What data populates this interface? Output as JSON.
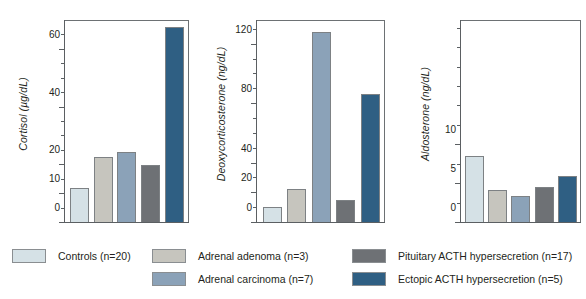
{
  "chart_data": [
    {
      "type": "bar",
      "title": "",
      "ylabel": "Cortisol (µg/dL)",
      "xlabel": "",
      "ylim": [
        0,
        70
      ],
      "grid": false,
      "tick_labels": [
        "0",
        "10",
        "20",
        "40",
        "60"
      ],
      "tick_values": [
        0,
        10,
        20,
        40,
        60
      ],
      "minor_tick_values": [
        5,
        15,
        25,
        30,
        35,
        45,
        50,
        55,
        65
      ],
      "categories": [
        "Controls (n=20)",
        "Adrenal adenoma (n=3)",
        "Adrenal carcinoma (n=7)",
        "Pituitary ACTH hypersecretion (n=17)",
        "Ectopic ACTH hypersecretion (n=5)"
      ],
      "values": [
        11.7,
        22.7,
        24.2,
        19.6,
        67.5
      ]
    },
    {
      "type": "bar",
      "title": "",
      "ylabel": "Deoxycorticosterone (ng/dL)",
      "xlabel": "",
      "ylim": [
        0,
        136
      ],
      "grid": false,
      "tick_labels": [
        "0",
        "20",
        "40",
        "80",
        "120"
      ],
      "tick_values": [
        0,
        20,
        40,
        80,
        120
      ],
      "minor_tick_values": [
        10,
        30,
        50,
        60,
        70,
        90,
        100,
        110,
        130
      ],
      "categories": [
        "Controls (n=20)",
        "Adrenal adenoma (n=3)",
        "Adrenal carcinoma (n=7)",
        "Pituitary ACTH hypersecretion (n=17)",
        "Ectopic ACTH hypersecretion (n=5)"
      ],
      "values": [
        10.0,
        22.0,
        128.0,
        15.0,
        86.0
      ]
    },
    {
      "type": "bar",
      "title": "",
      "ylabel": "Aldosterone (ng/dL)",
      "xlabel": "",
      "ylim": [
        0,
        26
      ],
      "grid": false,
      "tick_labels": [
        "0",
        "5",
        "10"
      ],
      "tick_values": [
        0,
        5,
        10
      ],
      "minor_tick_values": [
        2.5,
        7.5,
        12.5,
        15,
        17.5,
        20,
        22.5,
        25
      ],
      "categories": [
        "Controls (n=20)",
        "Adrenal adenoma (n=3)",
        "Adrenal carcinoma (n=7)",
        "Pituitary ACTH hypersecretion (n=17)",
        "Ectopic ACTH hypersecretion (n=5)"
      ],
      "values": [
        8.5,
        4.1,
        3.4,
        4.5,
        5.9
      ]
    }
  ],
  "legend": {
    "position": "bottom",
    "columns": [
      {
        "entries": [
          {
            "label": "Controls (n=20)",
            "color": "#d5e1e6"
          }
        ]
      },
      {
        "entries": [
          {
            "label": "Adrenal adenoma (n=3)",
            "color": "#c6c5be"
          },
          {
            "label": "Adrenal carcinoma (n=7)",
            "color": "#8ba2b8"
          }
        ]
      },
      {
        "entries": [
          {
            "label": "Pituitary ACTH hypersecretion (n=17)",
            "color": "#6e7175"
          },
          {
            "label": "Ectopic ACTH hypersecretion (n=5)",
            "color": "#2f5f83"
          }
        ]
      }
    ]
  },
  "series_colors": [
    "#d5e1e6",
    "#c6c5be",
    "#8ba2b8",
    "#6e7175",
    "#2f5f83"
  ],
  "caption": ""
}
